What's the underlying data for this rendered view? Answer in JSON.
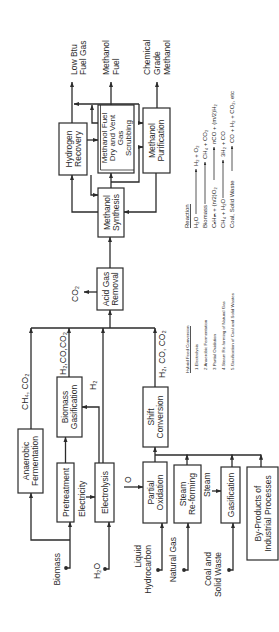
{
  "colors": {
    "line": "#2b2b2b",
    "background": "#ffffff"
  },
  "outputs": {
    "low_btu": [
      "Low Btu",
      "Fuel Gas"
    ],
    "methanol_fuel": [
      "Methanol",
      "Fuel"
    ],
    "chemical_methanol": [
      "Chemical",
      "Grade",
      "Methanol"
    ]
  },
  "inputs": {
    "biomass": [
      "Biomass"
    ],
    "water": [
      "H₂O"
    ],
    "liquid_hydrocarbon": [
      "Liquid",
      "Hydrocarbon"
    ],
    "natural_gas": [
      "Natural Gas"
    ],
    "coal_solid_waste": [
      "Coal and",
      "Solid Waste"
    ]
  },
  "units": {
    "hydrogen_recovery": [
      "Hydrogen",
      "Recovery"
    ],
    "methanol_fuel_scrubbing": [
      "Methanol Fuel",
      "Dry and Vent",
      "Gas",
      "Scrubbing"
    ],
    "methanol_purification": [
      "Methanol",
      "Purification"
    ],
    "methanol_synthesis": [
      "Methanol",
      "Synthesis"
    ],
    "acid_gas_removal": [
      "Acid Gas",
      "Removal"
    ],
    "anaerobic_fermentation": [
      "Anaerobic",
      "Fermentation"
    ],
    "biomass_gasification": [
      "Biomass",
      "Gasification"
    ],
    "pretreatment": [
      "Pretreatment"
    ],
    "electrolysis": [
      "Electrolysis"
    ],
    "shift_conversion": [
      "Shift",
      "Conversion"
    ],
    "partial_oxidation": [
      "Partial",
      "Oxidation"
    ],
    "steam_reforming": [
      "Steam",
      "Re-forming"
    ],
    "gasification": [
      "Gasification"
    ],
    "by_products": [
      "By-Products of",
      "Industrial Processes"
    ]
  },
  "streams": {
    "anaerobic_out": "CH₄, CO₂",
    "biomass_gasification_out": "H₂,CO,CO₂",
    "electrolysis_h2": "H₂",
    "shift_out": "H₂, CO, CO₂",
    "acid_gas_co2": "CO₂",
    "electricity": "Electricity",
    "oxygen": "O",
    "steam": "Steam"
  },
  "legend_hybrid": {
    "title": "Hybrid Feed Conversion",
    "items": [
      "1.Electrolysis",
      "2 Anaerobic Fermentation",
      "3 Partial Oxidation",
      "4.Steam Re-forming of Natural Gas",
      "5.Gasification of Coal and Solid Wastes"
    ]
  },
  "legend_reactions": {
    "title": "Reaction",
    "rows": [
      {
        "reactants": "H₂O",
        "products": "H₂ + O₂"
      },
      {
        "reactants": "Biomass",
        "products": "CH₄ + CO₂"
      },
      {
        "reactants": "CₙHₘ + (n/2)O₂",
        "products": "nCO + (m/2)H₂"
      },
      {
        "reactants": "CH₄ + H₂O",
        "products": "3H₂ + CO"
      },
      {
        "reactants": "Coal, Solid Waste",
        "products": "CO + H₂ + CO₂, etc"
      }
    ]
  }
}
